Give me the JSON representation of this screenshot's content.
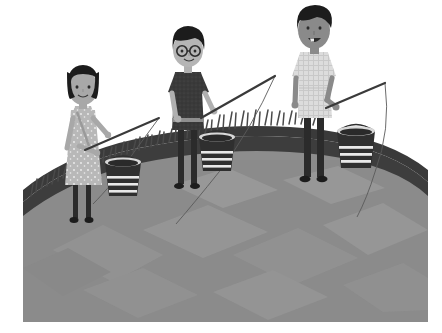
{
  "artwork": {
    "title": "Three children fishing at a pond",
    "style": "flat-vector-illustration-grayscale",
    "canvas": {
      "width": 442,
      "height": 333,
      "background": "#ffffff"
    },
    "content_box": {
      "x": 23,
      "y": 0,
      "width": 405,
      "height": 322
    }
  },
  "palette": {
    "background": "#ffffff",
    "water": "#8d8d8d",
    "water_highlight": "#a3a3a3",
    "water_shadow": "#7b7b7b",
    "bank": "#3d3d3d",
    "grass": "#4a4a4a",
    "skin_light": "#a8a8a8",
    "skin_mid": "#9a9a9a",
    "skin_dark": "#7e7e7e",
    "hair_black": "#1c1c1c",
    "shirt_dark": "#3a3a3a",
    "shirt_light": "#dcdcdc",
    "dress_light": "#b8b8b8",
    "pants_dark": "#2b2b2b",
    "bucket_dark": "#2f2f2f",
    "bucket_stripe": "#e8e8e8",
    "rod": "#3a3a3a",
    "line": "#4d4d4d"
  },
  "scene": {
    "water_label": "pond-water",
    "bank_label": "grassy-bank",
    "grass_label": "grass-tufts"
  },
  "figures": [
    {
      "id": "girl-left",
      "name": "girl-fishing",
      "description": "Girl with black bob haircut wearing a patterned light dress, holding a fishing rod",
      "hair": "bob",
      "skin": "#a8a8a8",
      "outfit": "dotted dress",
      "has_glasses": false,
      "position": {
        "x": 45,
        "y": 75
      }
    },
    {
      "id": "boy-middle",
      "name": "boy-with-glasses-fishing",
      "description": "Boy with round glasses, black hair, dark t-shirt and slim dark trousers holding a rod",
      "hair": "short",
      "skin": "#b0b0b0",
      "outfit": "dark t-shirt",
      "has_glasses": true,
      "position": {
        "x": 148,
        "y": 40
      }
    },
    {
      "id": "teen-right",
      "name": "teen-fishing",
      "description": "Taller smiling teen with dark skin, black hair, light checked shirt and dark trousers holding a rod",
      "hair": "short",
      "skin": "#8a8a8a",
      "outfit": "light checked shirt",
      "has_glasses": false,
      "position": {
        "x": 272,
        "y": 15
      }
    }
  ],
  "buckets": [
    {
      "id": "bucket-left",
      "name": "bucket",
      "x": 85,
      "y": 160,
      "width": 30,
      "height": 36
    },
    {
      "id": "bucket-middle",
      "name": "bucket",
      "x": 178,
      "y": 135,
      "width": 30,
      "height": 36
    },
    {
      "id": "bucket-right",
      "name": "bucket",
      "x": 317,
      "y": 130,
      "width": 32,
      "height": 38
    }
  ],
  "fishing_rods": [
    {
      "id": "rod-left",
      "name": "fishing-rod",
      "handle": {
        "x": 64,
        "y": 147
      },
      "tip": {
        "x": 136,
        "y": 118
      },
      "line_end": {
        "x": 62,
        "y": 200
      }
    },
    {
      "id": "rod-middle",
      "name": "fishing-rod",
      "handle": {
        "x": 178,
        "y": 117
      },
      "tip": {
        "x": 252,
        "y": 76
      },
      "line_end": {
        "x": 152,
        "y": 223
      }
    },
    {
      "id": "rod-right",
      "name": "fishing-rod",
      "handle": {
        "x": 303,
        "y": 107
      },
      "tip": {
        "x": 362,
        "y": 83
      },
      "line_end": {
        "x": 333,
        "y": 216
      }
    }
  ]
}
